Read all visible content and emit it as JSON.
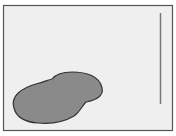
{
  "figure": {
    "background": "#efefef",
    "border_color": "#555555",
    "blob_fill": "#8a8a8a",
    "blob_stroke": "#333333",
    "line_color": "#777777"
  }
}
